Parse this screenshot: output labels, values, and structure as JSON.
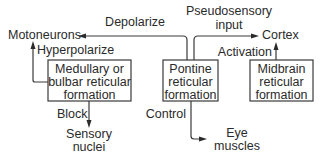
{
  "diagram": {
    "nodes": {
      "motoneurons": "Motoneurons",
      "cortex": "Cortex",
      "sensory_nuclei": [
        "Sensory",
        "nuclei"
      ],
      "eye_muscles": [
        "Eye",
        "muscles"
      ],
      "medullary": [
        "Medullary or",
        "bulbar reticular",
        "formation"
      ],
      "pontine": [
        "Pontine",
        "reticular",
        "formation"
      ],
      "midbrain": [
        "Midbrain",
        "reticular",
        "formation"
      ]
    },
    "edges": {
      "depolarize": "Depolarize",
      "pseudosensory": [
        "Pseudosensory",
        "input"
      ],
      "hyperpolarize": "Hyperpolarize",
      "activation": "Activation",
      "block": "Block",
      "control": "Control"
    }
  }
}
